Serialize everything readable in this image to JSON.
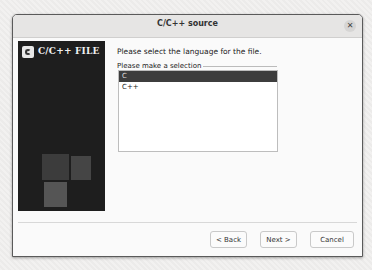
{
  "window": {
    "title": "C/C++ source",
    "close_icon": "close-icon"
  },
  "side_panel": {
    "title": "C/C++ FILE",
    "logo_icon": "c-file-logo-icon"
  },
  "main": {
    "header": "Please select the language for the file.",
    "group_label": "Please make a selection",
    "options": [
      {
        "label": "C",
        "selected": true
      },
      {
        "label": "C++",
        "selected": false
      }
    ]
  },
  "buttons": {
    "back": "< Back",
    "next": "Next >",
    "cancel": "Cancel"
  }
}
